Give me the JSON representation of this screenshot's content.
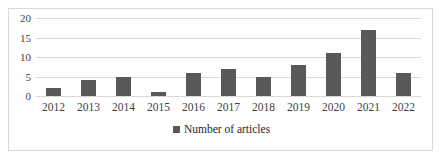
{
  "chart_data": {
    "type": "bar",
    "title": "",
    "subtitle": "",
    "xlabel": "",
    "ylabel": "",
    "categories": [
      "2012",
      "2013",
      "2014",
      "2015",
      "2016",
      "2017",
      "2018",
      "2019",
      "2020",
      "2021",
      "2022"
    ],
    "values": [
      2,
      4,
      5,
      1,
      6,
      7,
      5,
      8,
      11,
      17,
      6
    ],
    "series": [
      {
        "name": "Number of articles",
        "values": [
          2,
          4,
          5,
          1,
          6,
          7,
          5,
          8,
          11,
          17,
          6
        ]
      }
    ],
    "ylim": [
      0,
      20
    ],
    "yticks": [
      "0",
      "5",
      "10",
      "15",
      "20"
    ],
    "ytick_values": [
      0,
      5,
      10,
      15,
      20
    ],
    "grid": true,
    "legend_position": "bottom",
    "legend": [
      "Number of articles"
    ],
    "colors": {
      "bar": "#595959",
      "gridline": "#d9d9d9",
      "border": "#d9d9d9",
      "tick_label": "#404040",
      "legend_label": "#262626",
      "background": "#ffffff"
    }
  }
}
